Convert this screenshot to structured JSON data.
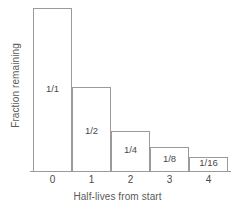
{
  "chart_data": {
    "type": "bar",
    "title": "",
    "xlabel": "Half-lives from start",
    "ylabel": "Fraction remaining",
    "categories": [
      "0",
      "1",
      "2",
      "3",
      "4"
    ],
    "values": [
      1,
      0.5,
      0.25,
      0.125,
      0.0625
    ],
    "bar_labels": [
      "1/1",
      "1/2",
      "1/4",
      "1/8",
      "1/16"
    ],
    "ylim": [
      0,
      1.05
    ],
    "grid": false,
    "legend": false,
    "colors": {
      "bar_fill": "#ffffff",
      "bar_edge": "#9a9a9a",
      "axis": "#9a9a9a",
      "text": "#4a4a4a",
      "axis_title": "#5a5a5a",
      "background": "#ffffff"
    },
    "bars": [
      {
        "category": "0",
        "label": "1/1",
        "value": 1,
        "height_frac": 1.0,
        "label_offset_frac": 0.47
      },
      {
        "category": "1",
        "label": "1/2",
        "value": 0.5,
        "height_frac": 0.515,
        "label_offset_frac": 0.42
      },
      {
        "category": "2",
        "label": "1/4",
        "value": 0.25,
        "height_frac": 0.245,
        "label_offset_frac": 0.4
      },
      {
        "category": "3",
        "label": "1/8",
        "value": 0.125,
        "height_frac": 0.148,
        "label_offset_frac": 0.28
      },
      {
        "category": "4",
        "label": "1/16",
        "value": 0.0625,
        "height_frac": 0.085,
        "label_offset_frac": 0.18
      }
    ]
  }
}
